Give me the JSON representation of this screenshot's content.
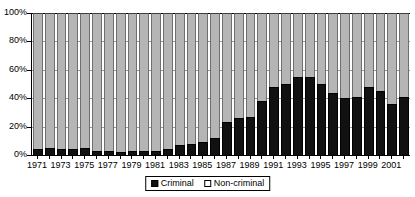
{
  "chart_data": {
    "type": "bar",
    "subtype": "stacked-100-percent",
    "title": "",
    "xlabel": "",
    "ylabel": "",
    "ylim": [
      0,
      100
    ],
    "yticks": [
      "0%",
      "20%",
      "40%",
      "60%",
      "80%",
      "100%"
    ],
    "ytick_values": [
      0,
      20,
      40,
      60,
      80,
      100
    ],
    "grid": true,
    "legend_position": "bottom-center",
    "categories": [
      "1971",
      "1972",
      "1973",
      "1974",
      "1975",
      "1976",
      "1977",
      "1978",
      "1979",
      "1980",
      "1981",
      "1982",
      "1983",
      "1984",
      "1985",
      "1986",
      "1987",
      "1988",
      "1989",
      "1990",
      "1991",
      "1992",
      "1993",
      "1994",
      "1995",
      "1996",
      "1997",
      "1998",
      "1999",
      "2000",
      "2001",
      "2002"
    ],
    "xtick_labels": [
      "1971",
      "1973",
      "1975",
      "1977",
      "1979",
      "1981",
      "1983",
      "1985",
      "1987",
      "1989",
      "1991",
      "1993",
      "1995",
      "1997",
      "1999",
      "2001"
    ],
    "series": [
      {
        "name": "Criminal",
        "color": "#111111",
        "values": [
          4,
          5,
          4,
          4,
          5,
          3,
          3,
          2,
          3,
          3,
          3,
          4,
          7,
          8,
          9,
          12,
          23,
          26,
          27,
          38,
          48,
          50,
          55,
          55,
          50,
          44,
          40,
          41,
          48,
          45,
          36,
          41
        ]
      },
      {
        "name": "Non-criminal",
        "color": "#b5b5b5",
        "values": [
          96,
          95,
          96,
          96,
          95,
          97,
          97,
          98,
          97,
          97,
          97,
          96,
          93,
          92,
          91,
          88,
          77,
          74,
          73,
          62,
          52,
          50,
          45,
          45,
          50,
          56,
          60,
          59,
          52,
          55,
          64,
          59
        ]
      }
    ]
  },
  "legend": {
    "items": [
      {
        "label": "Criminal",
        "swatch": "filled-square"
      },
      {
        "label": "Non-criminal",
        "swatch": "hollow-square"
      }
    ]
  }
}
